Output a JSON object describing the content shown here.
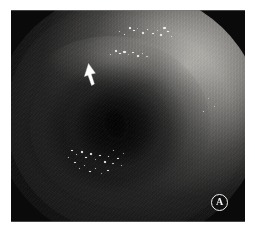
{
  "figure": {
    "type": "endoscopic-photograph",
    "modality": "white-light upper gastrointestinal endoscopy",
    "panel_label": "A",
    "background_color": "#ffffff",
    "frame_color": "#0a0a0a"
  },
  "plate": {
    "name": "endoscopy-image-plate",
    "caption": "",
    "field_of_view": "circular endoscope field with masked black corners"
  },
  "annotations": {
    "arrow": {
      "label": "arrow-marker",
      "color": "#ffffff",
      "direction": "up-left",
      "points_to": "mucosal lesion on superior gastric fold",
      "x": 72,
      "y": 53
    },
    "panel_badge": {
      "label": "A",
      "text_color": "#f6f6f2",
      "background_color": "#111111",
      "border_color": "#f4f4f0"
    }
  },
  "features": {
    "lumen": {
      "label": "gastric-lumen-opening",
      "tone": "#050505"
    },
    "folds": [
      {
        "label": "outer-mucosal-fold"
      },
      {
        "label": "mid-mucosal-fold"
      },
      {
        "label": "inner-mucosal-fold"
      }
    ],
    "speckles_label": "mucus-and-light-reflection-speckles"
  },
  "colors": {
    "mucosa_light": "#d6d4ce",
    "mucosa_mid": "#8e8c88",
    "mucosa_dark": "#1a1a1a",
    "speckle": "#f2f2ee",
    "mask": "#0a0a0a",
    "page": "#ffffff"
  }
}
